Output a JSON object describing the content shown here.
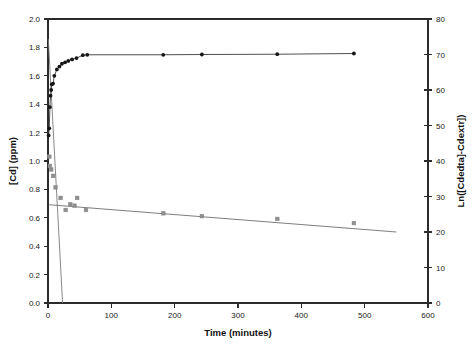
{
  "chart_data": {
    "type": "scatter",
    "title": "",
    "xlabel": "Time (minutes)",
    "ylabel": "[Cd] (ppm)",
    "y2label": "Ln([Cdedta]-Cdextr])",
    "xlim": [
      0,
      600
    ],
    "ylim": [
      0.0,
      2.0
    ],
    "y2lim": [
      0,
      80
    ],
    "xticks": [
      0,
      100,
      200,
      300,
      400,
      500,
      600
    ],
    "xticklabels": [
      "0",
      "100",
      "200",
      "300",
      "400",
      "500",
      "600"
    ],
    "yticks": [
      0.0,
      0.2,
      0.4,
      0.6,
      0.8,
      1.0,
      1.2,
      1.4,
      1.6,
      1.8,
      2.0
    ],
    "yticklabels": [
      "0.0",
      "0.2",
      "0.4",
      "0.6",
      "0.8",
      "1.0",
      "1.2",
      "1.4",
      "1.6",
      "1.8",
      "2.0"
    ],
    "y2ticks": [
      0,
      10,
      20,
      30,
      40,
      50,
      60,
      70,
      80
    ],
    "y2ticklabels": [
      "0",
      "10",
      "20",
      "30",
      "40",
      "50",
      "60",
      "70",
      "80"
    ],
    "grid": false,
    "legend": false,
    "series": [
      {
        "name": "Cd extracted",
        "marker": "filled-circle",
        "axis": "left",
        "color": "#151515",
        "line": true,
        "points": [
          {
            "x": 1,
            "y": 1.18
          },
          {
            "x": 2,
            "y": 1.23
          },
          {
            "x": 3,
            "y": 1.38
          },
          {
            "x": 4,
            "y": 1.46
          },
          {
            "x": 5,
            "y": 1.5
          },
          {
            "x": 6,
            "y": 1.54
          },
          {
            "x": 8,
            "y": 1.545
          },
          {
            "x": 10,
            "y": 1.6
          },
          {
            "x": 14,
            "y": 1.645
          },
          {
            "x": 18,
            "y": 1.665
          },
          {
            "x": 22,
            "y": 1.685
          },
          {
            "x": 27,
            "y": 1.695
          },
          {
            "x": 32,
            "y": 1.705
          },
          {
            "x": 38,
            "y": 1.715
          },
          {
            "x": 45,
            "y": 1.725
          },
          {
            "x": 55,
            "y": 1.745
          },
          {
            "x": 62,
            "y": 1.748
          },
          {
            "x": 182,
            "y": 1.748
          },
          {
            "x": 243,
            "y": 1.75
          },
          {
            "x": 362,
            "y": 1.752
          },
          {
            "x": 483,
            "y": 1.757
          }
        ]
      },
      {
        "name": "Ln([Cdedta]-Cdextr])",
        "marker": "gray-square",
        "axis": "right",
        "color": "#8e8e8e",
        "line": false,
        "points": [
          {
            "x": 2,
            "y": 1.03
          },
          {
            "x": 3,
            "y": 0.965
          },
          {
            "x": 5,
            "y": 0.94
          },
          {
            "x": 8,
            "y": 0.895
          },
          {
            "x": 12,
            "y": 0.815
          },
          {
            "x": 20,
            "y": 0.74
          },
          {
            "x": 28,
            "y": 0.655
          },
          {
            "x": 35,
            "y": 0.695
          },
          {
            "x": 42,
            "y": 0.685
          },
          {
            "x": 46,
            "y": 0.74
          },
          {
            "x": 60,
            "y": 0.655
          },
          {
            "x": 182,
            "y": 0.632
          },
          {
            "x": 243,
            "y": 0.612
          },
          {
            "x": 362,
            "y": 0.592
          },
          {
            "x": 483,
            "y": 0.563
          }
        ]
      }
    ],
    "fit_lines": [
      {
        "name": "slow-decay-regression",
        "axis": "left",
        "color": "#6e6e6e",
        "x": [
          2,
          550
        ],
        "y": [
          0.692,
          0.5
        ]
      },
      {
        "name": "fast-decay-regression",
        "axis": "left",
        "color": "#7a7a7a",
        "x": [
          0.5,
          23
        ],
        "y": [
          1.86,
          0.0
        ]
      }
    ]
  },
  "axes": {
    "x_title": "Time (minutes)",
    "y_left_title": "[Cd] (ppm)",
    "y_right_title": "Ln([Cdedta]-Cdextr])"
  }
}
